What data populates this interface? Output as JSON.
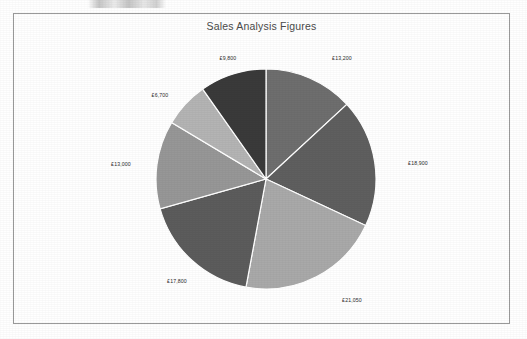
{
  "chart": {
    "title": "Sales Analysis Figures",
    "currency_symbol": "£"
  },
  "chart_data": {
    "type": "pie",
    "title": "Sales Analysis Figures",
    "categories": [
      "£13,200",
      "£18,900",
      "£21,050",
      "£17,800",
      "£13,000",
      "£6,700",
      "£9,800"
    ],
    "values": [
      13200,
      18900,
      21050,
      17800,
      13000,
      6700,
      9800
    ],
    "labels": [
      "£13,200",
      "£18,900",
      "£21,050",
      "£17,800",
      "£13,000",
      "£6,700",
      "£9,800"
    ],
    "colors": [
      "#6e6e6e",
      "#5f5f5f",
      "#a9a9a9",
      "#5c5c5c",
      "#979797",
      "#b4b4b4",
      "#3a3a3a"
    ],
    "total": 100450,
    "start_angle_deg": 0,
    "direction": "clockwise",
    "legend": "none",
    "grid": false,
    "xlabel": "",
    "ylabel": "",
    "slice_separator_color": "#ffffff",
    "label_placement": "outside"
  },
  "slices": [
    {
      "label": "£13,200",
      "value": 13200,
      "color": "#6e6e6e",
      "label_x": 328,
      "label_y": 44
    },
    {
      "label": "£18,900",
      "value": 18900,
      "color": "#5f5f5f",
      "label_x": 404,
      "label_y": 149
    },
    {
      "label": "£21,050",
      "value": 21050,
      "color": "#a9a9a9",
      "label_x": 338,
      "label_y": 286
    },
    {
      "label": "£17,800",
      "value": 17800,
      "color": "#5c5c5c",
      "label_x": 163,
      "label_y": 267
    },
    {
      "label": "£13,000",
      "value": 13000,
      "color": "#979797",
      "label_x": 107,
      "label_y": 150
    },
    {
      "label": "£6,700",
      "value": 6700,
      "color": "#b4b4b4",
      "label_x": 146,
      "label_y": 81
    },
    {
      "label": "£9,800",
      "value": 9800,
      "color": "#3a3a3a",
      "label_x": 214,
      "label_y": 44
    }
  ],
  "geometry": {
    "center_x": 252,
    "center_y": 165,
    "radius": 110
  }
}
